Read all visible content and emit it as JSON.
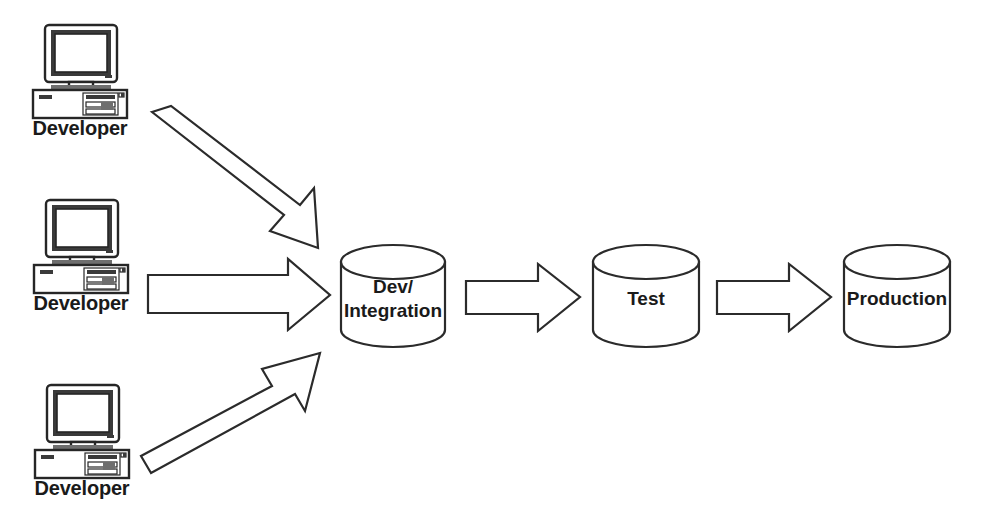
{
  "diagram": {
    "background_color": "#ffffff",
    "line_color": "#2b2b2b",
    "text_color": "#1a1a1a",
    "developers": [
      {
        "label": "Developer",
        "icon": "desktop-computer-icon"
      },
      {
        "label": "Developer",
        "icon": "desktop-computer-icon"
      },
      {
        "label": "Developer",
        "icon": "desktop-computer-icon"
      }
    ],
    "stages": [
      {
        "id": "dev-integration",
        "line1": "Dev/",
        "line2": "Integration",
        "icon": "database-cylinder-icon"
      },
      {
        "id": "test",
        "line1": "Test",
        "line2": "",
        "icon": "database-cylinder-icon"
      },
      {
        "id": "production",
        "line1": "Production",
        "line2": "",
        "icon": "database-cylinder-icon"
      }
    ],
    "arrows": [
      {
        "id": "arrow-dev1-to-integration",
        "direction": "down-right",
        "from": "Developer 1",
        "to": "Dev/Integration"
      },
      {
        "id": "arrow-dev2-to-integration",
        "direction": "right",
        "from": "Developer 2",
        "to": "Dev/Integration"
      },
      {
        "id": "arrow-dev3-to-integration",
        "direction": "up-right",
        "from": "Developer 3",
        "to": "Dev/Integration"
      },
      {
        "id": "arrow-integration-to-test",
        "direction": "right",
        "from": "Dev/Integration",
        "to": "Test"
      },
      {
        "id": "arrow-test-to-production",
        "direction": "right",
        "from": "Test",
        "to": "Production"
      }
    ]
  }
}
